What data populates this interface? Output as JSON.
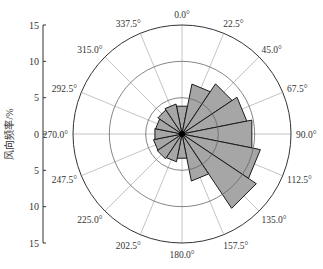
{
  "chart_data": {
    "type": "polar-bar",
    "title": "",
    "ylabel": "风向频率/%",
    "radial_ticks": [
      15,
      10,
      5,
      0,
      5,
      10,
      15
    ],
    "radial_grid": [
      5,
      10,
      15
    ],
    "rmax": 15,
    "angle_labels": [
      "0.0°",
      "22.5°",
      "45.0°",
      "67.5°",
      "90.0°",
      "112.5°",
      "135.0°",
      "157.5°",
      "180.0°",
      "202.5°",
      "225.0°",
      "247.5°",
      "270.0°",
      "292.5°",
      "315.0°",
      "337.5°"
    ],
    "categories": [
      0,
      22.5,
      45,
      67.5,
      90,
      112.5,
      135,
      157.5,
      180,
      202.5,
      225,
      247.5,
      270,
      292.5,
      315,
      337.5
    ],
    "values": [
      3.9,
      7.0,
      8.3,
      9.1,
      9.8,
      11.0,
      12.3,
      6.6,
      3.4,
      3.9,
      4.1,
      4.0,
      3.8,
      3.7,
      4.0,
      4.2
    ],
    "bar_color": "#a6a6a6",
    "edge_color": "#1a1a1a",
    "grid_color": "#9a9a9a",
    "grid": true,
    "legend": null
  }
}
